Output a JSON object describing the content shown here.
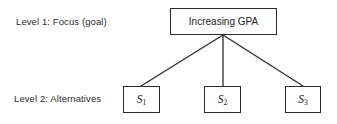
{
  "diagram": {
    "type": "hierarchy",
    "levels": [
      {
        "label": "Level 1:  Focus (goal)",
        "nodes": [
          "Increasing GPA"
        ]
      },
      {
        "label": "Level 2:  Alternatives",
        "nodes": [
          "S1",
          "S2",
          "S3"
        ]
      }
    ],
    "goal": {
      "text": "Increasing GPA"
    },
    "alternatives": [
      {
        "symbol": "S",
        "subscript": "1"
      },
      {
        "symbol": "S",
        "subscript": "2"
      },
      {
        "symbol": "S",
        "subscript": "3"
      }
    ],
    "edges": [
      {
        "from": "Increasing GPA",
        "to": "S1"
      },
      {
        "from": "Increasing GPA",
        "to": "S2"
      },
      {
        "from": "Increasing GPA",
        "to": "S3"
      }
    ],
    "colors": {
      "line": "#2b2b2b",
      "text": "#222222",
      "background": "#ffffff"
    }
  }
}
